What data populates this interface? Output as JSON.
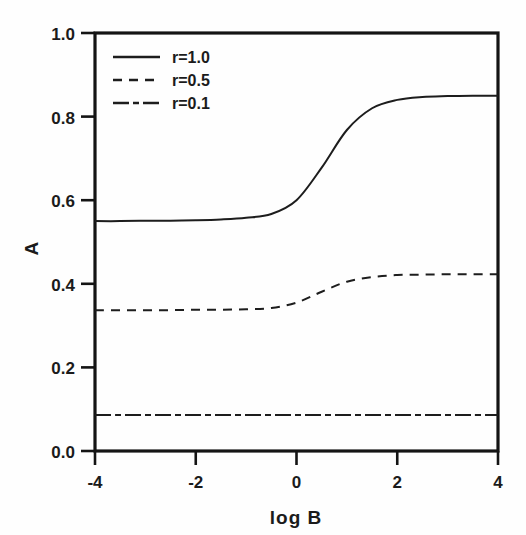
{
  "chart_data": {
    "type": "line",
    "title": "",
    "xlabel": "log B",
    "ylabel": "A",
    "xlim": [
      -4,
      4
    ],
    "ylim": [
      0.0,
      1.0
    ],
    "grid": false,
    "legend_position": "top-left",
    "xticks": [
      "-4",
      "-2",
      "0",
      "2",
      "4"
    ],
    "xtick_values": [
      -4,
      -2,
      0,
      2,
      4
    ],
    "yticks": [
      "0.0",
      "0.2",
      "0.4",
      "0.6",
      "0.8",
      "1.0"
    ],
    "ytick_values": [
      0.0,
      0.2,
      0.4,
      0.6,
      0.8,
      1.0
    ],
    "x": [
      -4.0,
      -3.5,
      -3.0,
      -2.5,
      -2.0,
      -1.5,
      -1.0,
      -0.5,
      0.0,
      0.5,
      1.0,
      1.5,
      2.0,
      2.5,
      3.0,
      3.5,
      4.0
    ],
    "series": [
      {
        "name": "r=1.0",
        "style": "solid",
        "values": [
          0.55,
          0.55,
          0.551,
          0.551,
          0.552,
          0.554,
          0.558,
          0.567,
          0.6,
          0.678,
          0.768,
          0.82,
          0.84,
          0.847,
          0.849,
          0.85,
          0.85
        ]
      },
      {
        "name": "r=0.5",
        "style": "dashed",
        "values": [
          0.337,
          0.337,
          0.337,
          0.337,
          0.338,
          0.338,
          0.339,
          0.342,
          0.355,
          0.381,
          0.405,
          0.416,
          0.421,
          0.422,
          0.423,
          0.423,
          0.423
        ]
      },
      {
        "name": "r=0.1",
        "style": "dashdot",
        "values": [
          0.086,
          0.086,
          0.086,
          0.086,
          0.086,
          0.086,
          0.086,
          0.086,
          0.086,
          0.086,
          0.086,
          0.086,
          0.086,
          0.086,
          0.086,
          0.086,
          0.086
        ]
      }
    ]
  },
  "axes": {
    "y_axis_label": "A",
    "x_axis_label": "log B",
    "y_tick_labels": [
      "1.0",
      "0.8",
      "0.6",
      "0.4",
      "0.2",
      "0.0"
    ],
    "x_tick_labels": [
      "-4",
      "-2",
      "0",
      "2",
      "4"
    ]
  },
  "legend": {
    "entries": [
      {
        "label": "r=1.0",
        "style": "solid"
      },
      {
        "label": "r=0.5",
        "style": "dashed"
      },
      {
        "label": "r=0.1",
        "style": "dashdot"
      }
    ]
  },
  "colors": {
    "line": "#1d1d1d",
    "frame": "#141414",
    "background": "#fefefe",
    "text": "#1b1b1b"
  }
}
